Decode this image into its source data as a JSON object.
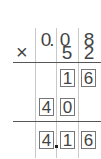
{
  "problem": {
    "multiplicand": [
      "0",
      ".",
      "0",
      "8"
    ],
    "operator": "×",
    "multiplier": [
      "5",
      "2"
    ],
    "partial_1": [
      "1",
      "6"
    ],
    "partial_2": [
      "4",
      "0"
    ],
    "result": [
      "4",
      ".",
      "1",
      "6"
    ]
  }
}
